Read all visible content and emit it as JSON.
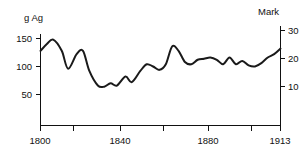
{
  "chart_data": {
    "type": "line",
    "title": "",
    "left_axis": {
      "label": "g Ag",
      "ticks": [
        150,
        100,
        50
      ],
      "tick_labels": [
        "150",
        "100",
        "50"
      ],
      "ylim": [
        25,
        160
      ]
    },
    "right_axis": {
      "label": "Mark",
      "ticks": [
        30,
        20,
        10
      ],
      "tick_labels": [
        "30",
        "20",
        "10"
      ],
      "ylim": [
        5,
        32
      ]
    },
    "xlabel": "",
    "x_tick_labels": [
      "1800",
      "1840",
      "1880",
      "1913"
    ],
    "x_ticks": [
      1800,
      1840,
      1880,
      1913
    ],
    "x_minor_ticks": [
      1813,
      1827,
      1853,
      1867,
      1893
    ],
    "xlim": [
      1800,
      1913
    ],
    "grid": false,
    "legend": null,
    "series": [
      {
        "name": "g Ag",
        "x": [
          1800,
          1803,
          1806,
          1810,
          1813,
          1817,
          1820,
          1823,
          1827,
          1830,
          1833,
          1836,
          1840,
          1843,
          1847,
          1850,
          1853,
          1856,
          1859,
          1862,
          1865,
          1868,
          1871,
          1874,
          1877,
          1880,
          1883,
          1886,
          1889,
          1892,
          1895,
          1898,
          1901,
          1904,
          1907,
          1910,
          1913
        ],
        "values": [
          128,
          140,
          148,
          128,
          96,
          122,
          128,
          92,
          66,
          64,
          70,
          66,
          82,
          72,
          92,
          104,
          100,
          94,
          104,
          136,
          128,
          108,
          104,
          112,
          114,
          116,
          112,
          104,
          116,
          104,
          110,
          102,
          100,
          106,
          116,
          122,
          132
        ]
      }
    ]
  }
}
